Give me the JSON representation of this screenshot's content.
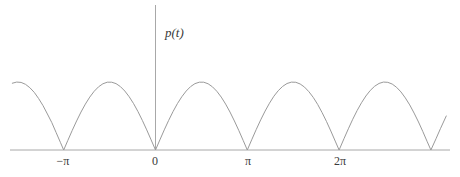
{
  "figure": {
    "name": "rectified-sine-plot",
    "background_color": "#ffffff",
    "line_color": "#9a9a9a",
    "axis_color": "#a8a8a8",
    "text_color": "#3a3a3a"
  },
  "axes": {
    "y_axis_label": "p(t)",
    "x_tick_labels": [
      {
        "key": "neg_pi",
        "text": "−π",
        "value": -3.14159
      },
      {
        "key": "zero",
        "text": "0",
        "value": 0
      },
      {
        "key": "pi",
        "text": "π",
        "value": 3.14159
      },
      {
        "key": "two_pi",
        "text": "2π",
        "value": 6.28319
      }
    ]
  },
  "chart_data": {
    "type": "line",
    "title": "",
    "xlabel": "",
    "ylabel": "p(t)",
    "function": "|sin(t)|",
    "grid": false,
    "legend": false,
    "xlim": [
      -4.9,
      9.95
    ],
    "ylim": [
      0,
      1.17
    ],
    "x_ticks": [
      -3.14159,
      0,
      3.14159,
      6.28319
    ],
    "x_tick_labels": [
      "−π",
      "0",
      "π",
      "2π"
    ],
    "y_ticks": [],
    "y_tick_labels": [],
    "series": [
      {
        "name": "p(t) = |sin t|",
        "x": [
          -4.9,
          -4.75,
          -4.6,
          -4.45,
          -4.3,
          -4.15,
          -4.0,
          -3.85,
          -3.7,
          -3.55,
          -3.4,
          -3.25,
          -3.14159,
          -3.0,
          -2.85,
          -2.7,
          -2.55,
          -2.4,
          -2.25,
          -2.1,
          -1.95,
          -1.8,
          -1.65,
          -1.5,
          -1.35,
          -1.2,
          -1.05,
          -0.9,
          -0.75,
          -0.6,
          -0.45,
          -0.3,
          -0.15,
          0.0,
          0.15,
          0.3,
          0.45,
          0.6,
          0.75,
          0.9,
          1.05,
          1.2,
          1.35,
          1.5,
          1.65,
          1.8,
          1.95,
          2.1,
          2.25,
          2.4,
          2.55,
          2.7,
          2.85,
          3.0,
          3.14159,
          3.3,
          3.45,
          3.6,
          3.75,
          3.9,
          4.05,
          4.2,
          4.35,
          4.5,
          4.65,
          4.8,
          4.95,
          5.1,
          5.25,
          5.4,
          5.55,
          5.7,
          5.85,
          6.0,
          6.15,
          6.28319,
          6.45,
          6.6,
          6.75,
          6.9,
          7.05,
          7.2,
          7.35,
          7.5,
          7.65,
          7.8,
          7.95,
          8.1,
          8.25,
          8.4,
          8.55,
          8.7,
          8.85,
          9.0,
          9.15,
          9.3,
          9.42478,
          9.6,
          9.75,
          9.95
        ],
        "y": [
          0.982,
          0.999,
          0.994,
          0.966,
          0.916,
          0.848,
          0.757,
          0.653,
          0.53,
          0.404,
          0.256,
          0.108,
          0.0,
          0.141,
          0.288,
          0.427,
          0.558,
          0.675,
          0.778,
          0.863,
          0.929,
          0.974,
          0.997,
          0.997,
          0.976,
          0.932,
          0.867,
          0.783,
          0.682,
          0.565,
          0.435,
          0.296,
          0.149,
          0.0,
          0.149,
          0.296,
          0.435,
          0.565,
          0.682,
          0.783,
          0.867,
          0.932,
          0.976,
          0.997,
          0.997,
          0.974,
          0.929,
          0.863,
          0.778,
          0.675,
          0.558,
          0.427,
          0.288,
          0.141,
          0.0,
          0.158,
          0.304,
          0.443,
          0.572,
          0.688,
          0.79,
          0.872,
          0.935,
          0.978,
          0.998,
          0.996,
          0.971,
          0.925,
          0.857,
          0.773,
          0.67,
          0.551,
          0.421,
          0.279,
          0.131,
          0.0,
          0.166,
          0.312,
          0.452,
          0.58,
          0.695,
          0.794,
          0.876,
          0.938,
          0.979,
          0.999,
          0.995,
          0.97,
          0.922,
          0.854,
          0.766,
          0.663,
          0.543,
          0.412,
          0.27,
          0.121,
          0.0,
          0.166,
          0.313,
          0.5
        ]
      }
    ],
    "zero_crossings": [
      -3.14159,
      0,
      3.14159,
      6.28319,
      9.42478
    ],
    "peak_value": 1.0,
    "period": 3.14159
  }
}
